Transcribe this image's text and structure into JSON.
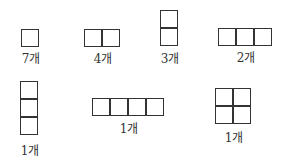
{
  "shapes": [
    {
      "id": "single-square",
      "rows": 1,
      "cols": 1,
      "count_label": "7개",
      "left": 22,
      "top": 30,
      "label_x": 31,
      "label_y": 53
    },
    {
      "id": "domino-horizontal",
      "rows": 1,
      "cols": 2,
      "count_label": "4개",
      "left": 85,
      "top": 30,
      "label_x": 103,
      "label_y": 53
    },
    {
      "id": "domino-vertical",
      "rows": 2,
      "cols": 1,
      "count_label": "3개",
      "left": 161,
      "top": 11,
      "label_x": 170,
      "label_y": 53
    },
    {
      "id": "tromino-horizontal",
      "rows": 1,
      "cols": 3,
      "count_label": "2개",
      "left": 219,
      "top": 29,
      "label_x": 246,
      "label_y": 52
    },
    {
      "id": "tromino-vertical",
      "rows": 3,
      "cols": 1,
      "count_label": "1개",
      "left": 21,
      "top": 82,
      "label_x": 30,
      "label_y": 145
    },
    {
      "id": "tetromino-horizontal",
      "rows": 1,
      "cols": 4,
      "count_label": "1개",
      "left": 93,
      "top": 99,
      "label_x": 129,
      "label_y": 123
    },
    {
      "id": "square-2x2",
      "rows": 2,
      "cols": 2,
      "count_label": "1개",
      "left": 216,
      "top": 89,
      "label_x": 234,
      "label_y": 132
    }
  ]
}
